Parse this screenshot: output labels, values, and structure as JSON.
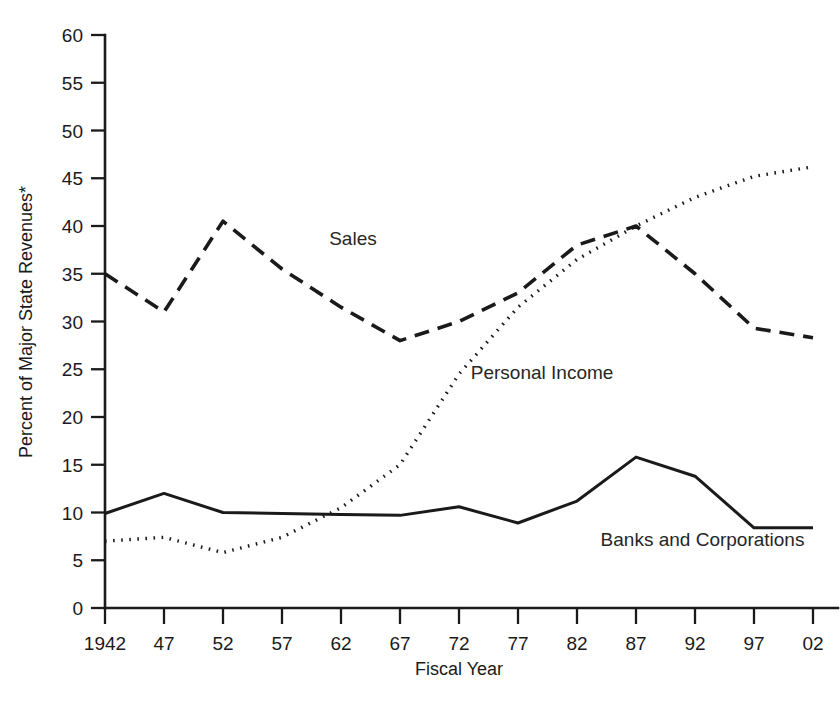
{
  "chart_data": {
    "type": "line",
    "title": "",
    "xlabel": "Fiscal Year",
    "ylabel": "Percent of Major State Revenues*",
    "x": [
      1942,
      1947,
      1952,
      1957,
      1962,
      1967,
      1972,
      1977,
      1982,
      1987,
      1992,
      1997,
      2002
    ],
    "x_tick_labels": [
      "1942",
      "47",
      "52",
      "57",
      "62",
      "67",
      "72",
      "77",
      "82",
      "87",
      "92",
      "97",
      "02"
    ],
    "y_tick_labels": [
      "0",
      "5",
      "10",
      "15",
      "20",
      "25",
      "30",
      "35",
      "40",
      "45",
      "50",
      "55",
      "60"
    ],
    "y_ticks": [
      0,
      5,
      10,
      15,
      20,
      25,
      30,
      35,
      40,
      45,
      50,
      55,
      60
    ],
    "ylim": [
      0,
      60
    ],
    "xlim": [
      1942,
      2002
    ],
    "grid": false,
    "legend_position": "inline-annotations",
    "series": [
      {
        "name": "Sales",
        "style": "dashed",
        "color": "#1a1a1a",
        "label_x": 1961,
        "label_y": 38,
        "values": [
          35.0,
          31.0,
          40.5,
          35.5,
          31.5,
          28.0,
          30.0,
          33.0,
          38.0,
          40.0,
          35.0,
          29.3,
          28.3
        ]
      },
      {
        "name": "Personal Income",
        "style": "dotted",
        "color": "#1a1a1a",
        "label_x": 1973,
        "label_y": 24,
        "values": [
          7.0,
          7.4,
          5.8,
          7.4,
          10.5,
          15.0,
          24.5,
          31.5,
          36.5,
          40.0,
          43.0,
          45.2,
          46.2
        ]
      },
      {
        "name": "Banks and Corporations",
        "style": "solid",
        "color": "#1a1a1a",
        "label_x": 1984,
        "label_y": 6.5,
        "values": [
          9.9,
          12.0,
          10.0,
          9.9,
          9.8,
          9.7,
          10.6,
          8.9,
          11.2,
          15.8,
          13.8,
          8.4,
          8.4
        ]
      }
    ],
    "footnote_marker": "*"
  },
  "plot_geometry": {
    "left": 105,
    "right": 813,
    "bottom": 608,
    "top": 35
  }
}
